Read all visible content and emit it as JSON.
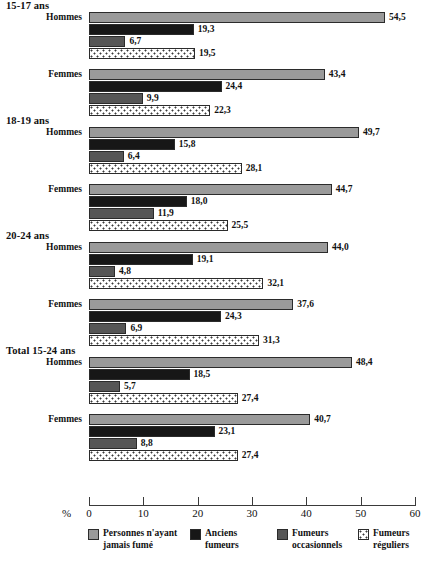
{
  "chart_data": {
    "type": "bar",
    "orientation": "horizontal",
    "title": "",
    "xlabel": "%",
    "ylabel": "",
    "xlim": [
      0,
      60
    ],
    "xticks": [
      0,
      10,
      20,
      30,
      40,
      50,
      60
    ],
    "xticklabels": [
      "0",
      "10",
      "20",
      "30",
      "40",
      "50",
      "60"
    ],
    "grid": false,
    "legend_position": "bottom",
    "series": [
      {
        "name": "Personnes n'ayant jamais fumé",
        "color": "#9a9a9a"
      },
      {
        "name": "Anciens fumeurs",
        "color": "#171717"
      },
      {
        "name": "Fumeurs occasionnels",
        "color": "#565656"
      },
      {
        "name": "Fumeurs réguliers",
        "color": "#ffffff"
      }
    ],
    "groups": [
      {
        "label": "15-17 ans",
        "subgroups": [
          {
            "label": "Hommes",
            "values": [
              54.5,
              19.3,
              6.7,
              19.5
            ],
            "value_labels": [
              "54,5",
              "19,3",
              "6,7",
              "19,5"
            ]
          },
          {
            "label": "Femmes",
            "values": [
              43.4,
              24.4,
              9.9,
              22.3
            ],
            "value_labels": [
              "43,4",
              "24,4",
              "9,9",
              "22,3"
            ]
          }
        ]
      },
      {
        "label": "18-19 ans",
        "subgroups": [
          {
            "label": "Hommes",
            "values": [
              49.7,
              15.8,
              6.4,
              28.1
            ],
            "value_labels": [
              "49,7",
              "15,8",
              "6,4",
              "28,1"
            ]
          },
          {
            "label": "Femmes",
            "values": [
              44.7,
              18.0,
              11.9,
              25.5
            ],
            "value_labels": [
              "44,7",
              "18,0",
              "11,9",
              "25,5"
            ]
          }
        ]
      },
      {
        "label": "20-24 ans",
        "subgroups": [
          {
            "label": "Hommes",
            "values": [
              44.0,
              19.1,
              4.8,
              32.1
            ],
            "value_labels": [
              "44,0",
              "19,1",
              "4,8",
              "32,1"
            ]
          },
          {
            "label": "Femmes",
            "values": [
              37.6,
              24.3,
              6.9,
              31.3
            ],
            "value_labels": [
              "37,6",
              "24,3",
              "6,9",
              "31,3"
            ]
          }
        ]
      },
      {
        "label": "Total 15-24 ans",
        "subgroups": [
          {
            "label": "Hommes",
            "values": [
              48.4,
              18.5,
              5.7,
              27.4
            ],
            "value_labels": [
              "48,4",
              "18,5",
              "5,7",
              "27,4"
            ]
          },
          {
            "label": "Femmes",
            "values": [
              40.7,
              23.1,
              8.8,
              27.4
            ],
            "value_labels": [
              "40,7",
              "23,1",
              "8,8",
              "27,4"
            ]
          }
        ]
      }
    ]
  },
  "axis": {
    "percent_symbol": "%"
  },
  "legend": {
    "items": [
      {
        "label": "Personnes n'ayant\njamais fumé",
        "style": "s0"
      },
      {
        "label": "Anciens\nfumeurs",
        "style": "s1"
      },
      {
        "label": "Fumeurs\noccasionnels",
        "style": "s2"
      },
      {
        "label": "Fumeurs\nréguliers",
        "style": "s3"
      }
    ]
  }
}
